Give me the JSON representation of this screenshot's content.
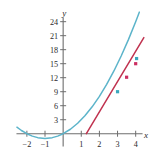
{
  "figure": {
    "name": "parabola-with-secant-line",
    "background_color": "#ffffff"
  },
  "chart_data": {
    "type": "line",
    "title": "",
    "xlabel": "x",
    "ylabel": "y",
    "xlim": [
      -2.6,
      4.9
    ],
    "ylim": [
      -2.2,
      26.5
    ],
    "grid": false,
    "legend": "none",
    "axis_color": "#6e6e6e",
    "xticks": [
      -2,
      -1,
      1,
      2,
      3,
      4
    ],
    "xtick_labels": [
      "−2",
      "−1",
      "1",
      "2",
      "3",
      "4"
    ],
    "yticks": [
      3,
      6,
      9,
      12,
      15,
      18,
      21,
      24
    ],
    "ytick_labels": [
      "3",
      "6",
      "9",
      "12",
      "15",
      "18",
      "21",
      "24"
    ],
    "series": [
      {
        "name": "parabola",
        "type": "curve",
        "color": "#5cb4ca",
        "equation": "y = x^2 + 2x",
        "x_start": -2.55,
        "x_end": 4.35,
        "points": [
          [
            -2.55,
            1.4
          ],
          [
            -2.3,
            0.69
          ],
          [
            -2.0,
            0.0
          ],
          [
            -1.7,
            -0.51
          ],
          [
            -1.4,
            -0.84
          ],
          [
            -1.0,
            -1.0
          ],
          [
            -0.6,
            -0.84
          ],
          [
            -0.3,
            -0.51
          ],
          [
            0.0,
            0.0
          ],
          [
            0.4,
            0.96
          ],
          [
            0.8,
            2.24
          ],
          [
            1.2,
            3.84
          ],
          [
            1.6,
            5.76
          ],
          [
            2.0,
            8.0
          ],
          [
            2.4,
            10.56
          ],
          [
            2.8,
            13.44
          ],
          [
            3.2,
            16.64
          ],
          [
            3.6,
            20.16
          ],
          [
            4.0,
            24.0
          ],
          [
            4.2,
            26.04
          ]
        ]
      },
      {
        "name": "secant-line",
        "type": "line",
        "color": "#c0324f",
        "x_start": 1.28,
        "y_start": 0.0,
        "x_end": 4.45,
        "y_end": 20.6
      }
    ],
    "markers": [
      {
        "name": "point-on-curve-teal-lower",
        "x": 3.0,
        "y": 9.0,
        "color": "#3ba7bd",
        "shape": "square"
      },
      {
        "name": "point-on-curve-magenta-mid",
        "x": 3.5,
        "y": 12.1,
        "color": "#cc2f62",
        "shape": "square"
      },
      {
        "name": "point-on-curve-magenta-upper",
        "x": 4.0,
        "y": 15.0,
        "color": "#cc2f62",
        "shape": "square"
      },
      {
        "name": "point-on-curve-teal-upper",
        "x": 4.05,
        "y": 16.1,
        "color": "#3ba7bd",
        "shape": "square"
      }
    ]
  }
}
